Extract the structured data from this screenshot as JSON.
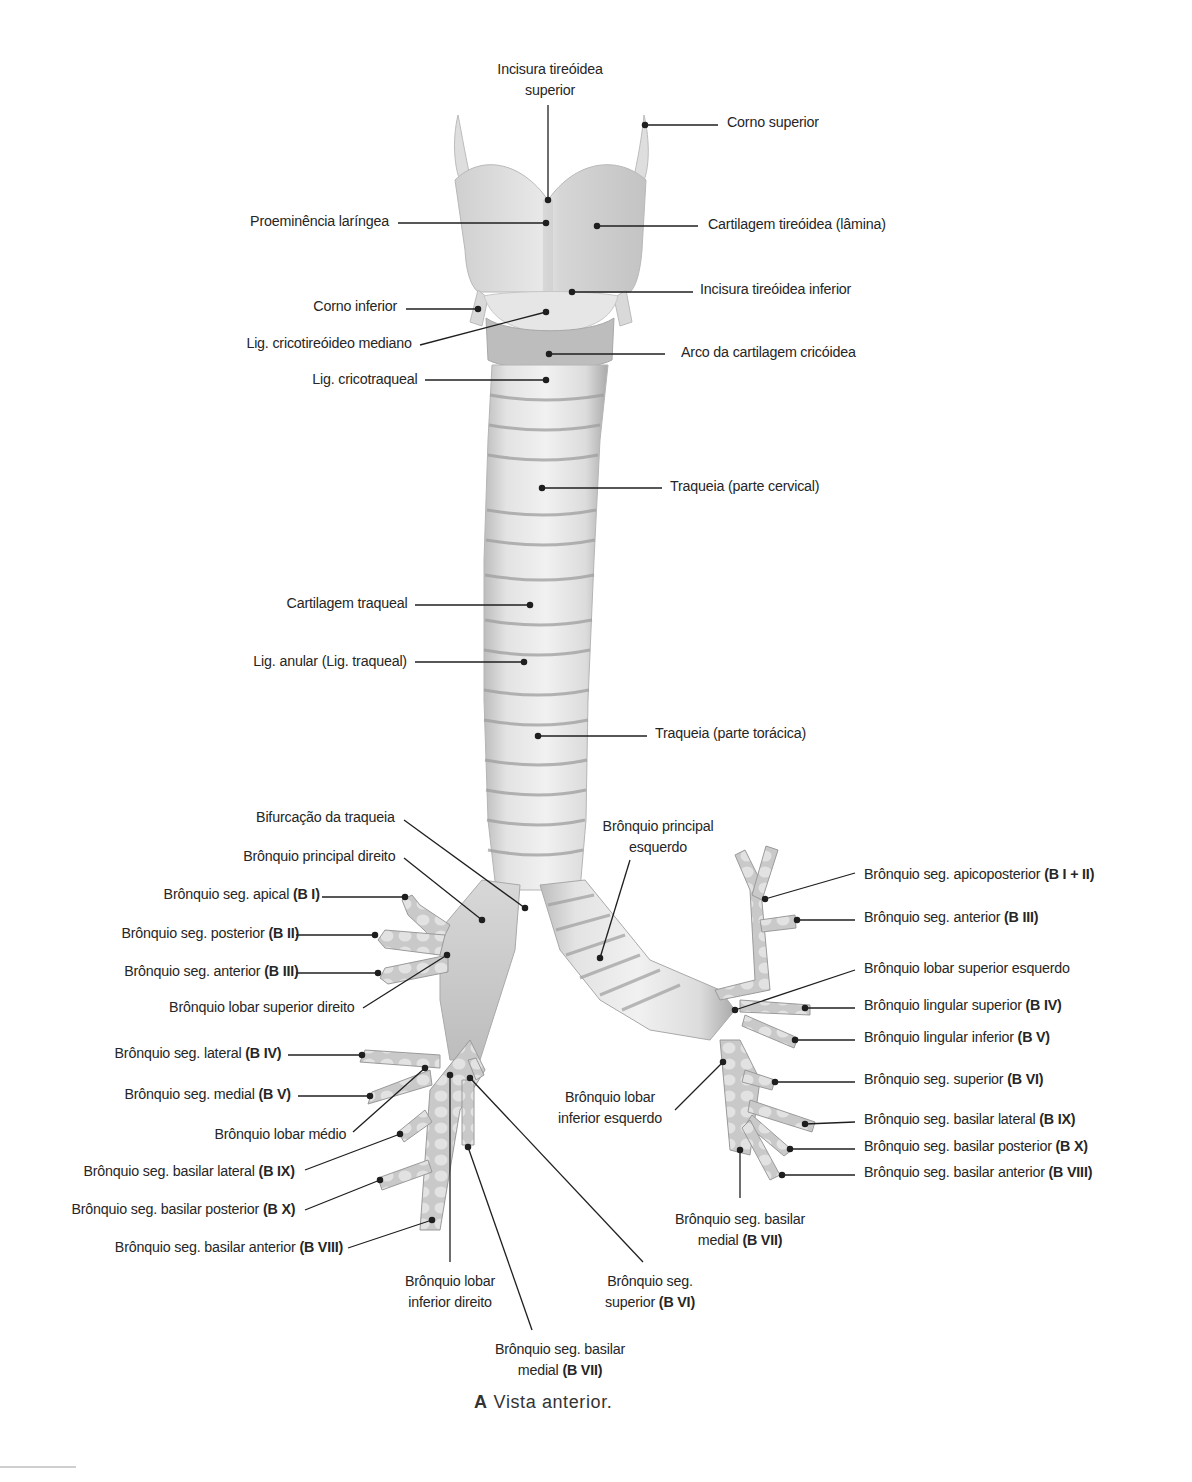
{
  "figure": {
    "caption_letter": "A",
    "caption_text": "Vista anterior.",
    "colors": {
      "background": "#ffffff",
      "cartilage_light": "#ececec",
      "cartilage_mid": "#cfcfcf",
      "cartilage_dark": "#9a9a9a",
      "leader_line": "#1f1f1f",
      "text": "#262626"
    }
  },
  "labels": {
    "incisura_tireoidea_superior": {
      "line1": "Incisura tireóidea",
      "line2": "superior"
    },
    "corno_superior": "Corno superior",
    "proeminencia_laringea": "Proeminência laríngea",
    "cartilagem_tireoidea": "Cartilagem tireóidea (lâmina)",
    "incisura_tireoidea_inferior": "Incisura tireóidea inferior",
    "corno_inferior": "Corno inferior",
    "lig_cricotireoideo_mediano": "Lig. cricotireóideo mediano",
    "arco_cartilagem_cricoidea": "Arco da cartilagem cricóidea",
    "lig_cricotraqueal": "Lig. cricotraqueal",
    "traqueia_cervical": "Traqueia (parte cervical)",
    "cartilagem_traqueal": "Cartilagem traqueal",
    "lig_anular": "Lig. anular (Lig. traqueal)",
    "traqueia_toracica": "Traqueia (parte torácica)",
    "bifurcacao_traqueia": "Bifurcação da traqueia",
    "bronquio_principal_direito": "Brônquio principal direito",
    "bronquio_principal_esquerdo": {
      "line1": "Brônquio principal",
      "line2": "esquerdo"
    },
    "right": {
      "apical": {
        "text": "Brônquio seg. apical ",
        "code": "(B I)"
      },
      "posterior": {
        "text": "Brônquio seg. posterior ",
        "code": "(B II)"
      },
      "anterior": {
        "text": "Brônquio seg. anterior ",
        "code": "(B III)"
      },
      "lobar_superior": "Brônquio lobar superior direito",
      "lateral": {
        "text": "Brônquio seg. lateral ",
        "code": "(B IV)"
      },
      "medial": {
        "text": "Brônquio seg. medial ",
        "code": "(B V)"
      },
      "lobar_medio": "Brônquio lobar médio",
      "basilar_lateral": {
        "text": "Brônquio seg. basilar lateral ",
        "code": "(B IX)"
      },
      "basilar_posterior": {
        "text": "Brônquio seg. basilar posterior ",
        "code": "(B X)"
      },
      "basilar_anterior": {
        "text": "Brônquio seg. basilar anterior ",
        "code": "(B VIII)"
      },
      "lobar_inferior": {
        "line1": "Brônquio lobar",
        "line2": "inferior direito"
      },
      "superior": {
        "line1": "Brônquio seg.",
        "line2_text": "superior ",
        "line2_code": "(B VI)"
      },
      "basilar_medial": {
        "line1": "Brônquio seg. basilar",
        "line2_text": "medial ",
        "line2_code": "(B VII)"
      }
    },
    "left": {
      "apicoposterior": {
        "text": "Brônquio seg. apicoposterior ",
        "code": "(B I + II)"
      },
      "anterior": {
        "text": "Brônquio seg. anterior ",
        "code": "(B III)"
      },
      "lobar_superior": "Brônquio lobar superior esquerdo",
      "lingular_superior": {
        "text": "Brônquio lingular superior ",
        "code": "(B IV)"
      },
      "lingular_inferior": {
        "text": "Brônquio lingular inferior ",
        "code": "(B V)"
      },
      "superior": {
        "text": "Brônquio seg. superior ",
        "code": "(B VI)"
      },
      "basilar_lateral": {
        "text": "Brônquio seg. basilar lateral ",
        "code": "(B IX)"
      },
      "basilar_posterior": {
        "text": "Brônquio seg. basilar posterior ",
        "code": "(B X)"
      },
      "basilar_anterior": {
        "text": "Brônquio seg. basilar anterior ",
        "code": "(B VIII)"
      },
      "lobar_inferior": {
        "line1": "Brônquio lobar",
        "line2": "inferior esquerdo"
      },
      "basilar_medial": {
        "line1": "Brônquio seg. basilar",
        "line2_text": "medial ",
        "line2_code": "(B VII)"
      }
    }
  }
}
